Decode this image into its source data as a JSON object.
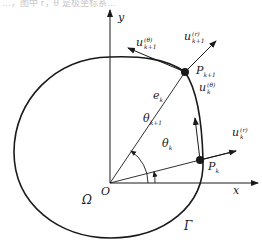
{
  "caption_fragment": "…，图中 r，θ 是极坐标系…",
  "axes": {
    "x_label": "x",
    "y_label": "y",
    "origin_label": "O"
  },
  "region": {
    "domain_label": "Ω",
    "boundary_label": "Γ"
  },
  "points": {
    "p_k1": {
      "name": "P",
      "sub": "k+1"
    },
    "p_k": {
      "name": "P",
      "sub": "k"
    }
  },
  "vectors": {
    "u_theta_k1": {
      "name": "u",
      "sup": "(θ)",
      "sub": "k+1"
    },
    "u_r_k1": {
      "name": "u",
      "sup": "(r)",
      "sub": "k+1"
    },
    "u_theta_k": {
      "name": "u",
      "sup": "(θ)",
      "sub": "k"
    },
    "u_r_k": {
      "name": "u",
      "sup": "(r)",
      "sub": "k"
    }
  },
  "segment": {
    "name": "e",
    "sub": "k"
  },
  "angles": {
    "theta_k1": {
      "name": "θ",
      "sub": "k+1"
    },
    "theta_k": {
      "name": "θ",
      "sub": "k"
    }
  },
  "colors": {
    "stroke": "#1a1a1a",
    "background": "#ffffff"
  }
}
